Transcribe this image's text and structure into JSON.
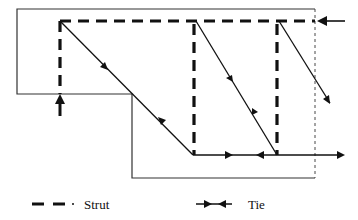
{
  "diagram": {
    "type": "strut-and-tie model",
    "colors": {
      "line": "#111111",
      "boundary": "#333333"
    },
    "boundary": {
      "outline": [
        [
          17,
          9
        ],
        [
          315,
          9
        ],
        [
          315,
          178
        ],
        [
          132,
          178
        ],
        [
          132,
          94
        ],
        [
          17,
          94
        ],
        [
          17,
          9
        ]
      ],
      "right_edge_style": "dotted"
    },
    "struts": [
      {
        "name": "top-strut",
        "from": [
          60,
          21
        ],
        "to": [
          315,
          21
        ]
      },
      {
        "name": "left-strut",
        "from": [
          60,
          21
        ],
        "to": [
          60,
          94
        ]
      },
      {
        "name": "middle-strut",
        "from": [
          194,
          21
        ],
        "to": [
          194,
          155
        ]
      },
      {
        "name": "right-strut",
        "from": [
          277,
          21
        ],
        "to": [
          277,
          155
        ]
      }
    ],
    "ties": [
      {
        "name": "diagonal-tie-1",
        "from": [
          60,
          21
        ],
        "to": [
          193,
          155
        ]
      },
      {
        "name": "diagonal-tie-2",
        "from": [
          196,
          21
        ],
        "to": [
          277,
          155
        ]
      },
      {
        "name": "diagonal-tie-3",
        "from": [
          279,
          21
        ],
        "to": [
          330,
          103
        ]
      },
      {
        "name": "bottom-tie",
        "from": [
          193,
          155
        ],
        "to": [
          342,
          155
        ]
      }
    ],
    "loads": [
      {
        "name": "support-reaction",
        "direction": "up",
        "at": [
          60,
          95
        ]
      },
      {
        "name": "horizontal-load",
        "direction": "left",
        "at": [
          318,
          21
        ]
      }
    ]
  },
  "legend": {
    "strut_label": "Strut",
    "tie_label": "Tie"
  }
}
